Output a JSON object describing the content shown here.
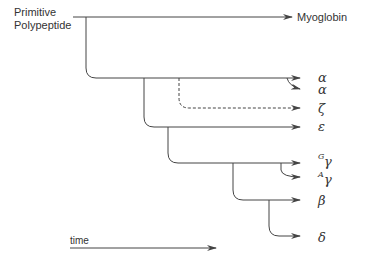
{
  "diagram": {
    "root_label_line1": "Primitive",
    "root_label_line2": "Polypeptide",
    "leaves": {
      "myoglobin": "Myoglobin",
      "alpha1": "α",
      "alpha2": "α",
      "zeta": "ζ",
      "epsilon": "ε",
      "gamma_g_sup": "G",
      "gamma_g": "γ",
      "gamma_a_sup": "A",
      "gamma_a": "γ",
      "beta": "β",
      "delta": "δ"
    },
    "time_label": "time"
  }
}
